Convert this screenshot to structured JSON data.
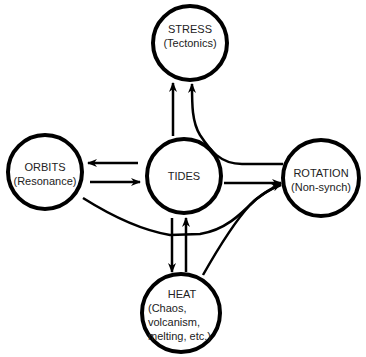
{
  "diagram": {
    "type": "node-link",
    "nodes": [
      {
        "id": "stress",
        "title": "STRESS",
        "subtitle": "(Tectonics)"
      },
      {
        "id": "orbits",
        "title": "ORBITS",
        "subtitle": "(Resonance)"
      },
      {
        "id": "tides",
        "title": "TIDES",
        "subtitle": ""
      },
      {
        "id": "rotation",
        "title": "ROTATION",
        "subtitle": "(Non-synch)"
      },
      {
        "id": "heat",
        "title": "HEAT",
        "subtitle_lines": [
          "(Chaos,",
          "volcanism,",
          "melting, etc.)"
        ]
      }
    ],
    "edges": [
      {
        "from": "tides",
        "to": "stress"
      },
      {
        "from": "rotation",
        "to": "stress"
      },
      {
        "from": "tides",
        "to": "orbits"
      },
      {
        "from": "orbits",
        "to": "tides"
      },
      {
        "from": "tides",
        "to": "rotation"
      },
      {
        "from": "orbits",
        "to": "rotation"
      },
      {
        "from": "heat",
        "to": "rotation"
      },
      {
        "from": "tides",
        "to": "heat"
      },
      {
        "from": "heat",
        "to": "tides"
      }
    ],
    "colors": {
      "stroke": "#000000",
      "text": "#222222",
      "background": "#ffffff"
    }
  }
}
